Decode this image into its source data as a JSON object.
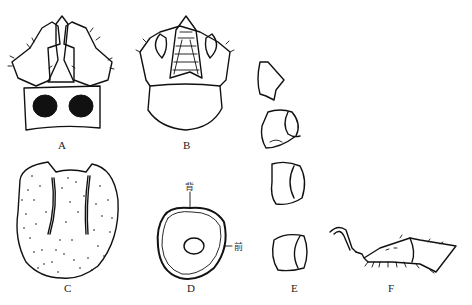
{
  "figure": {
    "panels": [
      {
        "id": "A",
        "label": "A",
        "description": "head capsule, dorsal view with two dark spots"
      },
      {
        "id": "B",
        "label": "B",
        "description": "head capsule, ventral view with mouthparts"
      },
      {
        "id": "C",
        "label": "C",
        "description": "stippled plate with two grooves"
      },
      {
        "id": "D",
        "label": "D",
        "description": "cross-section outline with inner ring"
      },
      {
        "id": "E",
        "label": "E",
        "description": "series of four segment outlines"
      },
      {
        "id": "F",
        "label": "F",
        "description": "leg in lateral view with claw and setae"
      }
    ],
    "annotations": {
      "dorsal": "背",
      "anterior": "前"
    },
    "colors": {
      "ink": "#111111",
      "background": "#ffffff"
    }
  }
}
